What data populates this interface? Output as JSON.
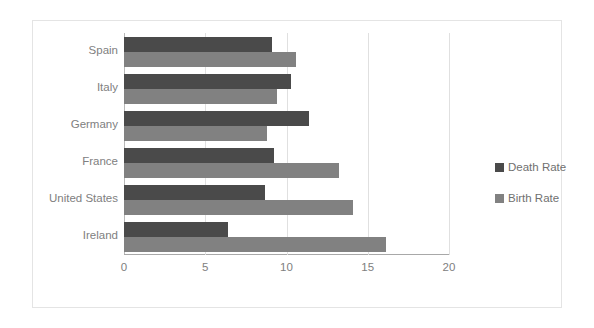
{
  "chart_data": {
    "type": "bar",
    "orientation": "horizontal",
    "title": "",
    "xlabel": "",
    "ylabel": "",
    "categories": [
      "Spain",
      "Italy",
      "Germany",
      "France",
      "United States",
      "Ireland"
    ],
    "series": [
      {
        "name": "Death Rate",
        "color": "#4a4a4a",
        "values": [
          9.1,
          10.3,
          11.4,
          9.2,
          8.7,
          6.4
        ]
      },
      {
        "name": "Birth Rate",
        "color": "#818181",
        "values": [
          10.6,
          9.4,
          8.8,
          13.2,
          14.1,
          16.1
        ]
      }
    ],
    "xlim": [
      0,
      20
    ],
    "xticks": [
      0,
      5,
      10,
      15,
      20
    ],
    "xtick_labels": [
      "0",
      "5",
      "10",
      "15",
      "20"
    ],
    "grid": true,
    "legend_position": "right"
  },
  "legend": {
    "items": [
      {
        "label": "Death Rate",
        "color": "#4a4a4a"
      },
      {
        "label": "Birth Rate",
        "color": "#818181"
      }
    ]
  }
}
